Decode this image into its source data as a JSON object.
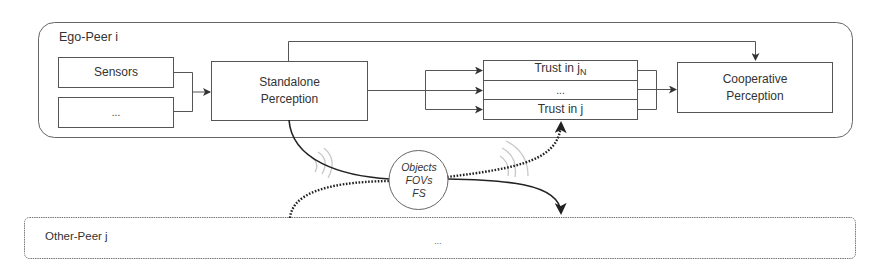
{
  "ego_peer": {
    "title": "Ego-Peer i",
    "sensors_label": "Sensors",
    "other_inputs_label": "...",
    "standalone": {
      "line1": "Standalone",
      "line2": "Perception"
    },
    "trust": {
      "row1_prefix": "Trust in j",
      "row1_sub": "N",
      "row2": "...",
      "row3": "Trust in j"
    },
    "cooperative": {
      "line1": "Cooperative",
      "line2": "Perception"
    }
  },
  "exchange": {
    "line1": "Objects",
    "line2": "FOVs",
    "line3": "FS"
  },
  "other_peer": {
    "title": "Other-Peer j",
    "content": "..."
  },
  "colors": {
    "stroke": "#555555",
    "arrow": "#333333",
    "signal": "#c8c8c8"
  }
}
